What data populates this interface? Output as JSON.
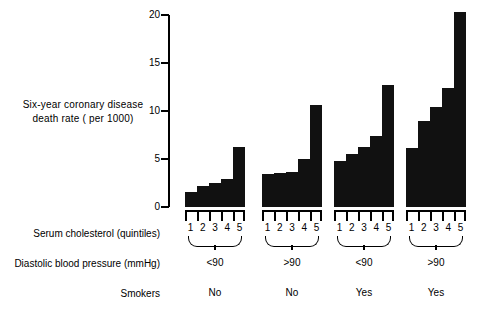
{
  "chart_data": {
    "type": "bar",
    "title": "",
    "ylabel": "Six-year coronary disease\ndeath rate ( per 1000)",
    "xlabel": "",
    "ylim": [
      0,
      20
    ],
    "ytick_labels": [
      "0",
      "5",
      "10",
      "15",
      "20"
    ],
    "ytick_values": [
      0,
      5,
      10,
      15,
      20
    ],
    "grid": false,
    "legend": false,
    "categories": [
      "1",
      "2",
      "3",
      "4",
      "5"
    ],
    "category_axis_label": "Serum cholesterol (quintiles)",
    "bar_color": "#111111",
    "groups": [
      {
        "name": "group-1",
        "diastolic_blood_pressure": "<90",
        "smokers": "No",
        "quintiles": [
          "1",
          "2",
          "3",
          "4",
          "5"
        ],
        "values": [
          1.6,
          2.2,
          2.5,
          2.9,
          6.2
        ]
      },
      {
        "name": "group-2",
        "diastolic_blood_pressure": ">90",
        "smokers": "No",
        "quintiles": [
          "1",
          "2",
          "3",
          "4",
          "5"
        ],
        "values": [
          3.4,
          3.5,
          3.6,
          5.0,
          10.6
        ]
      },
      {
        "name": "group-3",
        "diastolic_blood_pressure": "<90",
        "smokers": "Yes",
        "quintiles": [
          "1",
          "2",
          "3",
          "4",
          "5"
        ],
        "values": [
          4.8,
          5.5,
          6.3,
          7.4,
          12.7
        ]
      },
      {
        "name": "group-4",
        "diastolic_blood_pressure": ">90",
        "smokers": "Yes",
        "quintiles": [
          "1",
          "2",
          "3",
          "4",
          "5"
        ],
        "values": [
          6.1,
          9.0,
          10.4,
          12.4,
          20.3
        ]
      }
    ],
    "row_labels": {
      "cholesterol": "Serum cholesterol (quintiles)",
      "blood_pressure": "Diastolic blood pressure (mmHg)",
      "smokers": "Smokers"
    },
    "blood_pressure_values": [
      "<90",
      ">90",
      "<90",
      ">90"
    ],
    "smokers_values": [
      "No",
      "No",
      "Yes",
      "Yes"
    ]
  }
}
